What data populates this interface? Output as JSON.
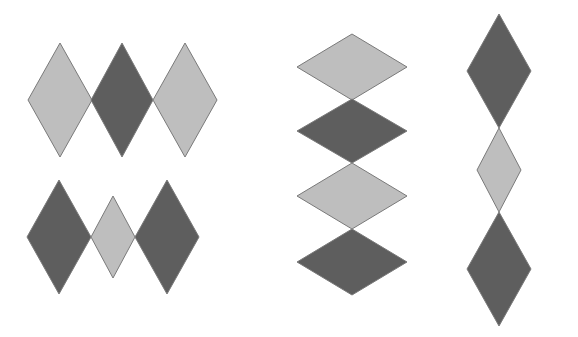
{
  "colors": {
    "background": "#ffffff",
    "light": "#bebebe",
    "dark": "#5e5e5e",
    "stroke": "#7a7a7a"
  },
  "groups": [
    {
      "name": "horizontal-row-top",
      "diamonds": [
        {
          "tone": "light",
          "cx": 60,
          "cy": 100,
          "rx": 32,
          "ry": 57
        },
        {
          "tone": "dark",
          "cx": 122,
          "cy": 100,
          "rx": 31,
          "ry": 57
        },
        {
          "tone": "light",
          "cx": 185,
          "cy": 100,
          "rx": 32,
          "ry": 57
        }
      ]
    },
    {
      "name": "horizontal-row-bottom",
      "diamonds": [
        {
          "tone": "dark",
          "cx": 59,
          "cy": 237,
          "rx": 32,
          "ry": 57
        },
        {
          "tone": "light",
          "cx": 113,
          "cy": 237,
          "rx": 22,
          "ry": 41
        },
        {
          "tone": "dark",
          "cx": 167,
          "cy": 237,
          "rx": 32,
          "ry": 57
        }
      ]
    },
    {
      "name": "vertical-stack-wide",
      "diamonds": [
        {
          "tone": "light",
          "cx": 352,
          "cy": 67,
          "rx": 55,
          "ry": 33
        },
        {
          "tone": "dark",
          "cx": 352,
          "cy": 131,
          "rx": 55,
          "ry": 32
        },
        {
          "tone": "light",
          "cx": 352,
          "cy": 196,
          "rx": 55,
          "ry": 33
        },
        {
          "tone": "dark",
          "cx": 352,
          "cy": 262,
          "rx": 55,
          "ry": 33
        }
      ]
    },
    {
      "name": "vertical-stack-narrow",
      "diamonds": [
        {
          "tone": "dark",
          "cx": 499,
          "cy": 71,
          "rx": 32,
          "ry": 57
        },
        {
          "tone": "light",
          "cx": 499,
          "cy": 170,
          "rx": 22,
          "ry": 42
        },
        {
          "tone": "dark",
          "cx": 499,
          "cy": 269,
          "rx": 32,
          "ry": 57
        }
      ]
    }
  ]
}
